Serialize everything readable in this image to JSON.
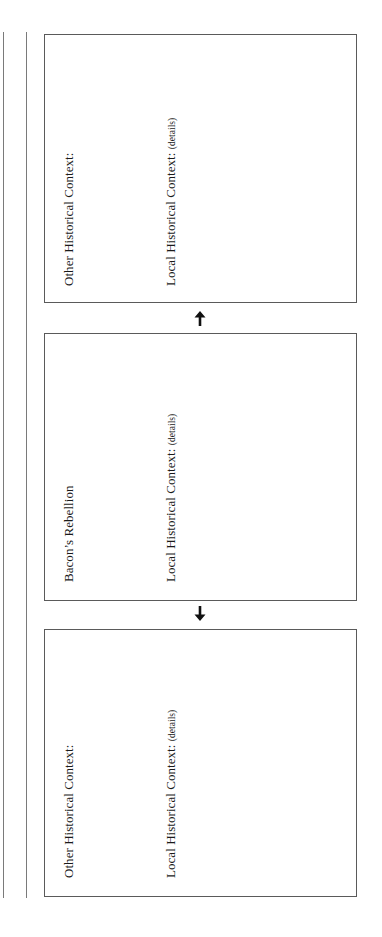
{
  "page": {
    "orientation": "rotated-90-counterclockwise",
    "accent_color": "#1a1a1a",
    "border_color": "#5a5a5a"
  },
  "organizer": {
    "boxes": [
      {
        "heading": "Other Historical Context:",
        "local_label": "Local Historical Context:",
        "local_hint": "(details)"
      },
      {
        "heading": "Bacon’s Rebellion",
        "local_label": "Local Historical Context:",
        "local_hint": "(details)"
      },
      {
        "heading": "Other Historical Context:",
        "local_label": "Local Historical Context:",
        "local_hint": "(details)"
      }
    ],
    "arrows": [
      {
        "icon": "arrow-up-icon",
        "between": "box-1-and-box-2"
      },
      {
        "icon": "arrow-down-icon",
        "between": "box-2-and-box-3"
      }
    ]
  }
}
